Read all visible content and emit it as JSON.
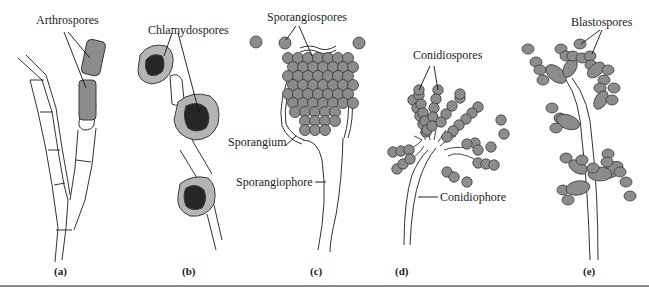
{
  "figure": {
    "colors": {
      "spore_fill": "#8c8c8c",
      "spore_stroke": "#3a3a3a",
      "chlamydo_outer": "#b4b4b4",
      "chlamydo_inner": "#262626",
      "outline": "#333333",
      "rule": "#8a8a8a"
    },
    "labels": {
      "arthrospores": "Arthrospores",
      "chlamydospores": "Chlamydospores",
      "sporangiospores": "Sporangiospores",
      "sporangium": "Sporangium",
      "sporangiophore": "Sporangiophore",
      "conidiospores": "Conidiospores",
      "conidiophore": "Conidiophore",
      "blastospores": "Blastospores"
    },
    "panels": {
      "a": "(a)",
      "b": "(b)",
      "c": "(c)",
      "d": "(d)",
      "e": "(e)"
    }
  }
}
